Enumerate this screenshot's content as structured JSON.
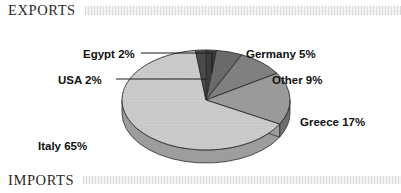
{
  "sections": {
    "top": {
      "title": "EXPORTS"
    },
    "bottom": {
      "title": "IMPORTS"
    }
  },
  "chart_data": {
    "type": "pie",
    "title": "EXPORTS",
    "subtitle": "",
    "xlabel": "",
    "ylabel": "",
    "legend_position": "none",
    "grid": false,
    "three_d": true,
    "units": "percent",
    "categories": [
      "Italy",
      "Greece",
      "Other",
      "Germany",
      "Egypt",
      "USA"
    ],
    "values": [
      65,
      17,
      9,
      5,
      2,
      2
    ],
    "labels": [
      "Italy 65%",
      "Greece 17%",
      "Other 9%",
      "Germany 5%",
      "Egypt 2%",
      "USA 2%"
    ],
    "slices": [
      {
        "name": "Egypt",
        "value": 2,
        "label": "Egypt 2%",
        "color": "#3d3d3d",
        "side_color": "#242424",
        "leader": true
      },
      {
        "name": "Germany",
        "value": 5,
        "label": "Germany 5%",
        "color": "#6a6a6a",
        "side_color": "#474747",
        "leader": false
      },
      {
        "name": "Other",
        "value": 9,
        "label": "Other 9%",
        "color": "#808080",
        "side_color": "#5a5a5a",
        "leader": false
      },
      {
        "name": "Greece",
        "value": 17,
        "label": "Greece 17%",
        "color": "#9a9a9a",
        "side_color": "#6e6e6e",
        "leader": false
      },
      {
        "name": "Italy",
        "value": 65,
        "label": "Italy 65%",
        "color": "#c9c9c9",
        "side_color": "#9d9d9d",
        "leader": false
      },
      {
        "name": "USA",
        "value": 2,
        "label": "USA 2%",
        "color": "#4a4a4a",
        "side_color": "#2c2c2c",
        "leader": true
      }
    ],
    "total": 100
  },
  "colors": {
    "background": "#ffffff",
    "text": "#111111",
    "header_text": "#2a2a2a",
    "rule_band": "#e4e4e4",
    "outline": "#3a3a3a"
  }
}
